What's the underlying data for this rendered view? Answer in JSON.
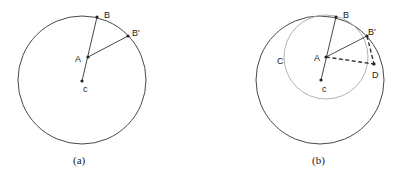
{
  "panels": [
    {
      "caption": "(a)",
      "labels": {
        "B": "B",
        "B_prime": "B'",
        "A": "A",
        "c": "c"
      }
    },
    {
      "caption": "(b)",
      "labels": {
        "B": "B",
        "B_prime": "B'",
        "A": "A",
        "c": "c",
        "C": "C",
        "D": "D"
      }
    }
  ],
  "colors": {
    "outer_circle": "#333333",
    "inner_circle": "#aaaaaa",
    "lines": "#333333",
    "points": "#222222"
  }
}
